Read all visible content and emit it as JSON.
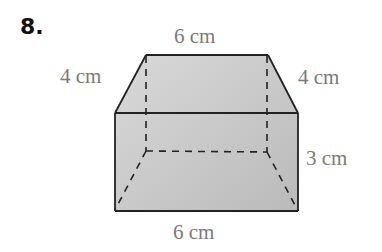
{
  "problem": {
    "number": "8."
  },
  "figure": {
    "type": "trapezoidal prism",
    "labels": {
      "top_edge": "6 cm",
      "left_slant": "4 cm",
      "right_slant": "4 cm",
      "height": "3 cm",
      "bottom_edge": "6 cm"
    },
    "colors": {
      "fill_light": "#d6d6d6",
      "fill_dark": "#bcbcbc",
      "edge": "#222222",
      "label_text": "#7a7a7a"
    }
  }
}
